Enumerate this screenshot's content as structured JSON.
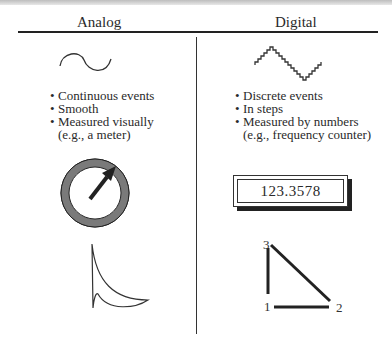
{
  "headings": {
    "analog": "Analog",
    "digital": "Digital"
  },
  "analog": {
    "bullets": [
      {
        "text": "Continuous events"
      },
      {
        "text": "Smooth"
      },
      {
        "text": "Measured visually"
      }
    ],
    "continuation": "(e.g., a meter)",
    "icons": {
      "waveform": "smooth-sine-wave-icon",
      "meter": "analog-meter-dial-icon",
      "curve": "analog-curve-icon"
    }
  },
  "digital": {
    "bullets": [
      {
        "text": "Discrete events"
      },
      {
        "text": "In steps"
      },
      {
        "text": "Measured by numbers"
      }
    ],
    "continuation": "(e.g., frequency counter)",
    "counter_value": "123.3578",
    "icons": {
      "waveform": "stepped-wave-icon",
      "counter": "digital-counter-display",
      "triangle": "numbered-triangle-icon"
    },
    "triangle_labels": {
      "p1": "1",
      "p2": "2",
      "p3": "3"
    }
  },
  "bullet_glyph": "•"
}
